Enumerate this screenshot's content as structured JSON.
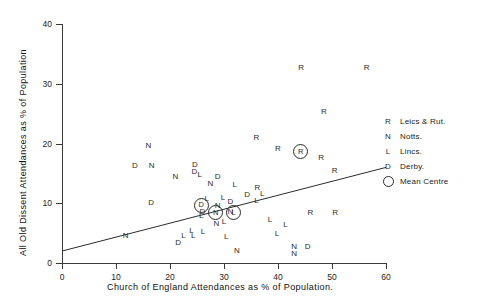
{
  "chart_data": {
    "type": "scatter",
    "title": "",
    "xlabel": "Church of England Attendances as % of Population.",
    "ylabel": "All Old Dissent Attendances as % of Population",
    "xlim": [
      0,
      60
    ],
    "ylim": [
      0,
      40
    ],
    "xticks": [
      0,
      10,
      20,
      30,
      40,
      50,
      60
    ],
    "yticks": [
      0,
      10,
      20,
      30,
      40
    ],
    "grid": false,
    "legend_position": "right",
    "legend": [
      {
        "key": "R",
        "label": "Leics & Rut."
      },
      {
        "key": "N",
        "label": "Notts."
      },
      {
        "key": "L",
        "label": "Lincs."
      },
      {
        "key": "D",
        "label": "Derby."
      },
      {
        "key": "circle",
        "label": "Mean Centre"
      }
    ],
    "series": [
      {
        "name": "Leics & Rut.",
        "marker": "R",
        "points": [
          {
            "x": 44.3,
            "y": 32.7
          },
          "R1",
          {
            "x": 56.4,
            "y": 32.7
          },
          {
            "x": 48.5,
            "y": 25.2
          },
          {
            "x": 36.0,
            "y": 21.0
          },
          {
            "x": 40.0,
            "y": 19.0
          },
          {
            "x": 48.0,
            "y": 17.6
          },
          {
            "x": 50.5,
            "y": 15.4
          },
          {
            "x": 46.0,
            "y": 8.3
          },
          {
            "x": 50.6,
            "y": 8.3
          },
          {
            "x": 36.2,
            "y": 12.6
          }
        ]
      },
      {
        "name": "Notts.",
        "marker": "N",
        "points": [
          {
            "x": 16.0,
            "y": 19.5
          },
          {
            "x": 16.6,
            "y": 16.2
          },
          {
            "x": 21.0,
            "y": 14.4
          },
          {
            "x": 27.5,
            "y": 13.2
          },
          {
            "x": 28.8,
            "y": 9.6
          },
          {
            "x": 31.2,
            "y": 8.6
          },
          {
            "x": 28.6,
            "y": 6.6
          },
          {
            "x": 11.8,
            "y": 4.6
          },
          {
            "x": 32.4,
            "y": 2.0
          },
          {
            "x": 43.0,
            "y": 2.7
          },
          {
            "x": 43.0,
            "y": 1.5
          }
        ]
      },
      {
        "name": "Lincs.",
        "marker": "L",
        "points": [
          {
            "x": 25.5,
            "y": 14.8
          },
          {
            "x": 32.0,
            "y": 13.0
          },
          {
            "x": 37.1,
            "y": 11.6
          },
          {
            "x": 29.8,
            "y": 10.9
          },
          {
            "x": 36.0,
            "y": 10.3
          },
          {
            "x": 26.8,
            "y": 10.7
          },
          {
            "x": 25.8,
            "y": 7.8
          },
          {
            "x": 30.0,
            "y": 6.8
          },
          {
            "x": 38.5,
            "y": 7.2
          },
          {
            "x": 41.4,
            "y": 6.4
          },
          {
            "x": 24.0,
            "y": 5.4
          },
          {
            "x": 26.1,
            "y": 5.2
          },
          {
            "x": 22.5,
            "y": 4.5
          },
          {
            "x": 24.3,
            "y": 4.5
          },
          {
            "x": 30.4,
            "y": 4.4
          },
          {
            "x": 39.8,
            "y": 4.9
          }
        ]
      },
      {
        "name": "Derby.",
        "marker": "D",
        "points": [
          {
            "x": 13.5,
            "y": 16.2
          },
          {
            "x": 24.5,
            "y": 15.2
          },
          {
            "x": 28.8,
            "y": 14.4
          },
          {
            "x": 16.5,
            "y": 10.0
          },
          {
            "x": 34.3,
            "y": 11.3
          },
          {
            "x": 31.2,
            "y": 10.2
          },
          {
            "x": 26.0,
            "y": 8.6
          },
          {
            "x": 21.5,
            "y": 3.4
          },
          {
            "x": 45.5,
            "y": 2.6
          },
          {
            "x": 24.6,
            "y": 16.4
          }
        ]
      },
      {
        "name": "Mean Centre",
        "marker": "circle",
        "points": [
          {
            "x": 44.0,
            "y": 18.8,
            "key": "R"
          },
          {
            "x": 25.6,
            "y": 9.8,
            "key": "D"
          },
          {
            "x": 28.3,
            "y": 8.6,
            "key": "N"
          },
          {
            "x": 31.6,
            "y": 8.6,
            "key": "L"
          }
        ]
      }
    ],
    "trendline": {
      "x0": 0,
      "y0": 2.0,
      "x1": 60,
      "y1": 16.0
    }
  }
}
